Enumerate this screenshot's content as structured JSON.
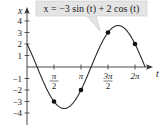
{
  "chart_data": {
    "type": "line",
    "title": "x = −3 sin (t) + 2 cos (t)",
    "xlabel": "t",
    "ylabel": "x",
    "function": "x = -3 sin(t) + 2 cos(t)",
    "xlim": [
      0,
      6.87
    ],
    "ylim": [
      -4.5,
      4.5
    ],
    "x_ticks": [
      {
        "value": 1.5708,
        "label_num": "π",
        "label_den": "2"
      },
      {
        "value": 3.1416,
        "label": "π"
      },
      {
        "value": 4.7124,
        "label_num": "3π",
        "label_den": "2"
      },
      {
        "value": 6.2832,
        "label": "2π"
      }
    ],
    "y_ticks": [
      {
        "value": 4,
        "label": "4"
      },
      {
        "value": 3,
        "label": "3"
      },
      {
        "value": 2,
        "label": "2"
      },
      {
        "value": 1,
        "label": "1"
      },
      {
        "value": -1,
        "label": "−1"
      },
      {
        "value": -2,
        "label": "−2"
      },
      {
        "value": -3,
        "label": "−3"
      },
      {
        "value": -4,
        "label": "−4"
      }
    ],
    "marked_points": [
      {
        "t": 1.5708,
        "x": -3
      },
      {
        "t": 3.1416,
        "x": -2
      },
      {
        "t": 4.7124,
        "x": 3
      },
      {
        "t": 6.2832,
        "x": 2
      }
    ],
    "curve_range": [
      0,
      6.871
    ],
    "grid": false,
    "colors": {
      "curve": "#2a2a2a",
      "axis": "#333333",
      "callout_bg": "#e4e4e4",
      "callout_border": "#c8c8c8",
      "point": "#111111"
    }
  }
}
